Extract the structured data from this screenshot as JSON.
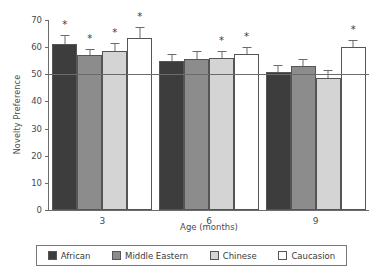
{
  "chart_data": {
    "type": "bar",
    "title": "",
    "xlabel": "Age (months)",
    "ylabel": "Novelty Preference",
    "categories": [
      "3",
      "6",
      "9"
    ],
    "ylim": [
      0,
      70
    ],
    "yticks": [
      0,
      10,
      20,
      30,
      40,
      50,
      60,
      70
    ],
    "grid": false,
    "legend_position": "bottom",
    "reference_line": 50,
    "series": [
      {
        "name": "African",
        "color": "#3d3d3d",
        "values": [
          61,
          55,
          51
        ],
        "errors": [
          3.5,
          2.5,
          2.5
        ],
        "significant": [
          true,
          false,
          false
        ]
      },
      {
        "name": "Middle Eastern",
        "color": "#8c8c8c",
        "values": [
          57,
          55.5,
          53
        ],
        "errors": [
          2.5,
          3,
          2.5
        ],
        "significant": [
          true,
          false,
          false
        ]
      },
      {
        "name": "Chinese",
        "color": "#d4d4d4",
        "values": [
          58.5,
          56,
          48.5
        ],
        "errors": [
          3,
          2.5,
          3
        ],
        "significant": [
          true,
          true,
          false
        ]
      },
      {
        "name": "Caucasion",
        "color": "#ffffff",
        "values": [
          63.5,
          57.5,
          60
        ],
        "errors": [
          4,
          2.5,
          2.5
        ],
        "significant": [
          true,
          true,
          true
        ]
      }
    ],
    "significance_marker": "*"
  }
}
